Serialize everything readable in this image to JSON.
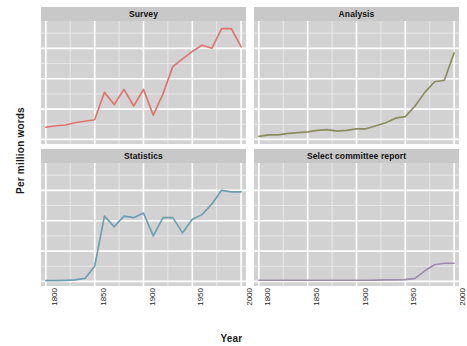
{
  "chart_data": {
    "type": "line",
    "title": "",
    "subtitle": "",
    "xlabel": "Year",
    "ylabel": "Per million words",
    "xlim": [
      1795,
      2005
    ],
    "ylim": [
      -3,
      78
    ],
    "xticks": [
      1800,
      1850,
      1900,
      1950,
      2000
    ],
    "yticks": [
      0,
      20,
      40,
      60
    ],
    "grid": true,
    "grid_major_color": "#ffffff",
    "grid_minor_color": "#ececec",
    "panel_background": "#d2d2d2",
    "strip_background": "#c8c8c8",
    "legend": "none",
    "facet_layout": "2x2",
    "panels": [
      {
        "label": "Survey",
        "color": "#e0736d",
        "x": [
          1800,
          1810,
          1820,
          1830,
          1840,
          1850,
          1860,
          1870,
          1880,
          1890,
          1900,
          1910,
          1920,
          1930,
          1940,
          1950,
          1960,
          1970,
          1980,
          1990,
          2000
        ],
        "y": [
          8,
          9,
          9.5,
          11,
          12,
          13,
          31,
          23,
          33,
          22,
          33,
          16,
          30,
          48,
          53,
          58,
          62,
          60,
          73,
          73,
          61
        ]
      },
      {
        "label": "Analysis",
        "color": "#8b8c5d",
        "x": [
          1800,
          1810,
          1820,
          1830,
          1840,
          1850,
          1860,
          1870,
          1880,
          1890,
          1900,
          1910,
          1920,
          1930,
          1940,
          1950,
          1960,
          1970,
          1980,
          1990,
          2000
        ],
        "y": [
          2,
          3,
          3,
          4,
          4.5,
          5,
          6,
          6.5,
          5.5,
          6,
          7,
          7,
          9,
          11,
          14,
          15,
          22,
          31,
          38,
          39,
          57
        ]
      },
      {
        "label": "Statistics",
        "color": "#6a9fb0",
        "x": [
          1800,
          1810,
          1820,
          1830,
          1840,
          1850,
          1860,
          1870,
          1880,
          1890,
          1900,
          1910,
          1920,
          1930,
          1940,
          1950,
          1960,
          1970,
          1980,
          1990,
          2000
        ],
        "y": [
          0.5,
          0.5,
          0.7,
          1,
          2,
          10,
          43,
          36,
          43,
          42,
          45,
          30,
          42,
          42,
          32,
          41,
          44,
          51,
          60,
          59,
          59
        ]
      },
      {
        "label": "Select committee report",
        "color": "#9d8dab",
        "x": [
          1800,
          1810,
          1820,
          1830,
          1840,
          1850,
          1860,
          1870,
          1880,
          1890,
          1900,
          1910,
          1920,
          1930,
          1940,
          1950,
          1960,
          1970,
          1980,
          1990,
          2000
        ],
        "y": [
          0.8,
          0.8,
          0.8,
          0.8,
          0.8,
          0.8,
          0.8,
          0.8,
          0.8,
          0.8,
          0.8,
          0.8,
          0.9,
          1,
          1,
          1.2,
          2,
          7,
          11,
          12,
          12
        ]
      }
    ]
  },
  "axes": {
    "ylabel": "Per million words",
    "xlabel": "Year",
    "ytick_labels": [
      "0",
      "20",
      "40",
      "60"
    ],
    "xtick_labels": [
      "1800",
      "1850",
      "1900",
      "1950",
      "2000"
    ]
  }
}
